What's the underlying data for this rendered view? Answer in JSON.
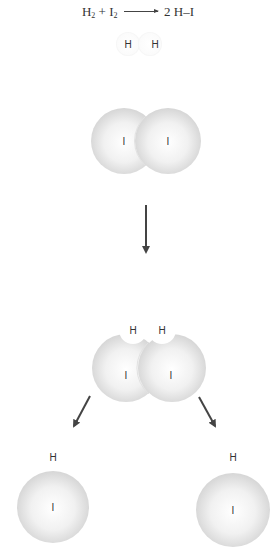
{
  "equation": {
    "reactant1": "H",
    "reactant1_sub": "2",
    "plus": "+",
    "reactant2": "I",
    "reactant2_sub": "2",
    "product": "2 H–I"
  },
  "stages": [
    {
      "name": "separate-reactants",
      "atoms": [
        {
          "label": "H"
        },
        {
          "label": "H"
        },
        {
          "label": "I"
        },
        {
          "label": "I"
        }
      ]
    },
    {
      "name": "transition-complex",
      "atoms": [
        {
          "label": "H"
        },
        {
          "label": "H"
        },
        {
          "label": "I"
        },
        {
          "label": "I"
        }
      ]
    },
    {
      "name": "products",
      "molecules": [
        {
          "h": "H",
          "i": "I"
        },
        {
          "h": "H",
          "i": "I"
        }
      ]
    }
  ],
  "labels": {
    "h": "H",
    "i": "I"
  },
  "colors": {
    "atom_fill_center": "#ffffff",
    "atom_fill_edge": "#d4d4d4",
    "arrow": "#444444",
    "text": "#333333"
  }
}
